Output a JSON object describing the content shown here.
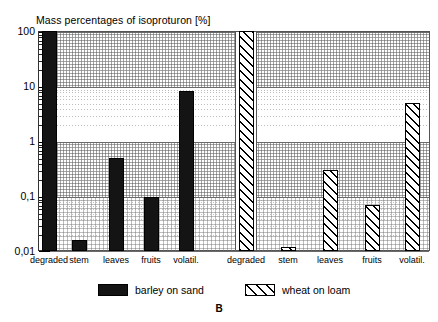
{
  "chart_data": {
    "type": "bar",
    "title": "Mass percentages of isoproturon [%]",
    "panel_letter": "B",
    "xlabel": "",
    "ylabel": "",
    "yscale": "log",
    "ylim": [
      0.01,
      100
    ],
    "ytick_labels": [
      "100",
      "10",
      "1",
      "0,1",
      "0,01"
    ],
    "ytick_values": [
      100,
      10,
      1,
      0.1,
      0.01
    ],
    "grid": true,
    "legend_position": "bottom",
    "groups": [
      {
        "name": "barley on sand",
        "categories": [
          "degraded",
          "stem",
          "leaves",
          "fruits",
          "volatil."
        ],
        "values": [
          100,
          0.016,
          0.5,
          0.095,
          8
        ]
      },
      {
        "name": "wheat on loam",
        "categories": [
          "degraded",
          "stem",
          "leaves",
          "fruits",
          "volatil."
        ],
        "values": [
          100,
          0.012,
          0.3,
          0.07,
          5
        ]
      }
    ],
    "series": [
      {
        "name": "barley on sand",
        "values": [
          100,
          0.016,
          0.5,
          0.095,
          8
        ],
        "fill": "solid",
        "color": "#141414"
      },
      {
        "name": "wheat on loam",
        "values": [
          100,
          0.012,
          0.3,
          0.07,
          5
        ],
        "fill": "hatch",
        "color": "#ffffff"
      }
    ],
    "categories": [
      "degraded",
      "stem",
      "leaves",
      "fruits",
      "volatil."
    ]
  },
  "legend": {
    "items": [
      {
        "label": "barley on sand",
        "pattern": "solid"
      },
      {
        "label": "wheat on loam",
        "pattern": "hatch"
      }
    ]
  }
}
